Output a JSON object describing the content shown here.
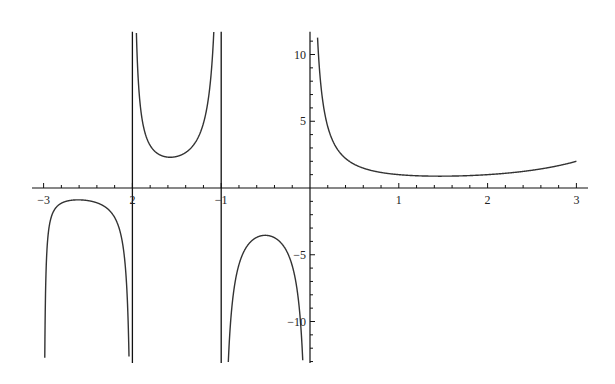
{
  "chart_data": {
    "type": "line",
    "title": "",
    "function": "Gamma(x)",
    "xlabel": "",
    "ylabel": "",
    "xlim": [
      -3.1,
      3.1
    ],
    "ylim": [
      -13.1,
      11.7
    ],
    "grid": false,
    "legend": null,
    "x_ticks": [
      -3,
      -2,
      -1,
      1,
      2,
      3
    ],
    "x_tick_labels": [
      "−3",
      "2",
      "−1",
      "1",
      "2",
      "3"
    ],
    "y_ticks": [
      -10,
      -5,
      5,
      10
    ],
    "y_tick_labels": [
      "−10",
      "−5",
      "5",
      "10"
    ],
    "asymptotes_x": [
      -2,
      -1
    ],
    "key_points": [
      {
        "x": -2.5,
        "y": -0.945
      },
      {
        "x": -1.5,
        "y": 2.363
      },
      {
        "x": -0.5,
        "y": -3.545
      },
      {
        "x": 1.0,
        "y": 1.0
      },
      {
        "x": 1.46,
        "y": 0.886
      },
      {
        "x": 2.0,
        "y": 1.0
      },
      {
        "x": 3.0,
        "y": 2.0
      }
    ],
    "line_color": "#333333",
    "axis_color": "#111111"
  }
}
